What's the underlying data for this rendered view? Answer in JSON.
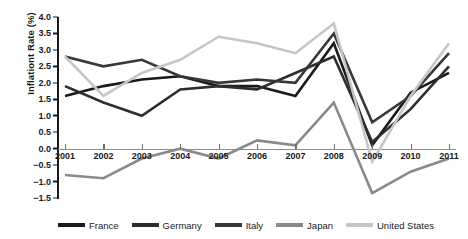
{
  "chart_data": {
    "type": "line",
    "title": "",
    "xlabel": "",
    "ylabel": "Inflationt Rate (%)",
    "x": [
      2001,
      2002,
      2003,
      2004,
      2005,
      2006,
      2007,
      2008,
      2009,
      2010,
      2011
    ],
    "categories": [
      "2001",
      "2002",
      "2003",
      "2004",
      "2005",
      "2006",
      "2007",
      "2008",
      "2009",
      "2010",
      "2011"
    ],
    "ylim": [
      -1.5,
      4.0
    ],
    "yticks": [
      4.0,
      3.5,
      3.0,
      2.5,
      2.0,
      1.5,
      1.0,
      0.5,
      0.0,
      -0.5,
      -1.0,
      -1.5
    ],
    "ytick_labels": [
      "4.0",
      "3.5",
      "3.0",
      "2.5",
      "2.0",
      "1.5",
      "1.0",
      "0.5",
      "0.0",
      "−0.5",
      "−1.0",
      "−1.5"
    ],
    "grid": false,
    "legend_position": "bottom",
    "series": [
      {
        "name": "France",
        "color": "#1a1a1a",
        "values": [
          1.6,
          1.9,
          2.1,
          2.2,
          1.9,
          1.9,
          1.6,
          3.2,
          0.1,
          1.7,
          2.3
        ]
      },
      {
        "name": "Germany",
        "color": "#2e2e2e",
        "values": [
          1.9,
          1.4,
          1.0,
          1.8,
          1.9,
          1.8,
          2.3,
          2.8,
          0.2,
          1.2,
          2.5
        ]
      },
      {
        "name": "Italy",
        "color": "#383838",
        "values": [
          2.8,
          2.5,
          2.7,
          2.2,
          2.0,
          2.1,
          2.0,
          3.5,
          0.8,
          1.6,
          2.9
        ]
      },
      {
        "name": "Japan",
        "color": "#8a8a8a",
        "values": [
          -0.8,
          -0.9,
          -0.3,
          0.0,
          -0.3,
          0.25,
          0.1,
          1.4,
          -1.35,
          -0.7,
          -0.3
        ]
      },
      {
        "name": "United States",
        "color": "#c6c6c6",
        "values": [
          2.8,
          1.6,
          2.3,
          2.7,
          3.4,
          3.2,
          2.9,
          3.8,
          -0.4,
          1.6,
          3.2
        ]
      }
    ]
  }
}
